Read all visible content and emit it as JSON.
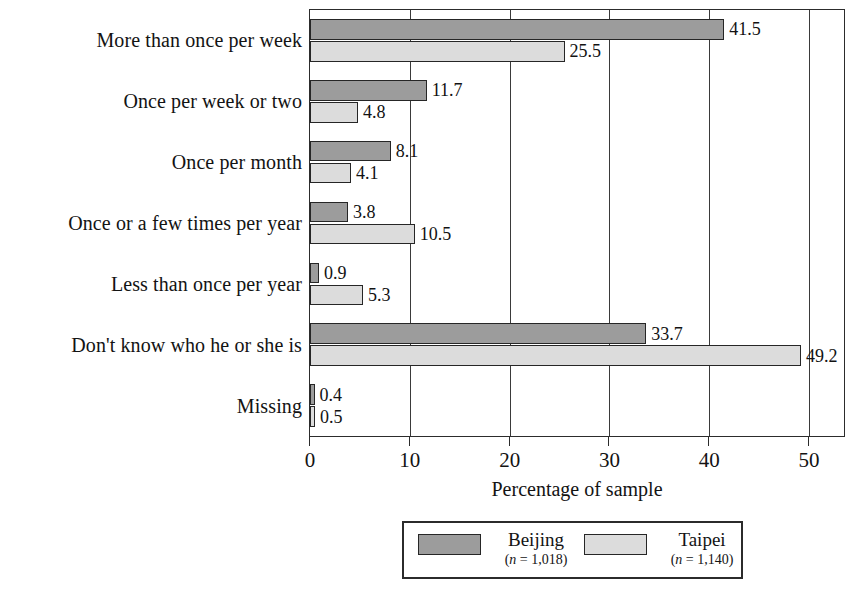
{
  "chart_data": {
    "type": "bar",
    "orientation": "horizontal",
    "title": "",
    "xlabel": "Percentage of sample",
    "ylabel": "",
    "xlim": [
      0,
      53.5
    ],
    "xticks": [
      0,
      10,
      20,
      30,
      40,
      50
    ],
    "xtick_labels": [
      "0",
      "10",
      "20",
      "30",
      "40",
      "50"
    ],
    "grid": true,
    "grid_axis": "x",
    "legend_position": "below-center",
    "categories": [
      "More than once per week",
      "Once per week or two",
      "Once per month",
      "Once or a few times per year",
      "Less than once per year",
      "Don't know who he or she is",
      "Missing"
    ],
    "series": [
      {
        "name": "Beijing",
        "n_label": "(n = 1,018)",
        "n": 1018,
        "color": "#9c9c9c",
        "values": [
          41.5,
          11.7,
          8.1,
          3.8,
          0.9,
          33.7,
          0.4
        ],
        "value_labels": [
          "41.5",
          "11.7",
          "8.1",
          "3.8",
          "0.9",
          "33.7",
          "0.4"
        ]
      },
      {
        "name": "Taipei",
        "n_label": "(n = 1,140)",
        "n": 1140,
        "color": "#dcdcdc",
        "values": [
          25.5,
          4.8,
          4.1,
          10.5,
          5.3,
          49.2,
          0.5
        ],
        "value_labels": [
          "25.5",
          "4.8",
          "4.1",
          "10.5",
          "5.3",
          "49.2",
          "0.5"
        ]
      }
    ]
  },
  "legend": {
    "entries": [
      {
        "label": "Beijing",
        "sub": "(n = 1,018)",
        "n_italic": "n",
        "n_rest": " = 1,018"
      },
      {
        "label": "Taipei",
        "sub": "(n = 1,140)",
        "n_italic": "n",
        "n_rest": " = 1,140"
      }
    ]
  }
}
